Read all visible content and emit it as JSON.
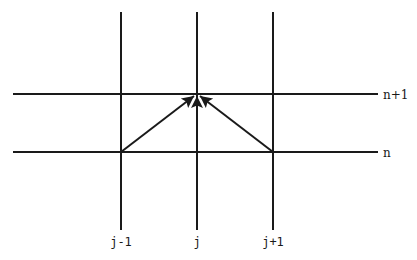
{
  "diagram": {
    "type": "finite-difference-stencil",
    "grid": {
      "line_color": "#1a1a1a",
      "vertical_lines": [
        {
          "label": "j-1",
          "x": 121
        },
        {
          "label": "j",
          "x": 197
        },
        {
          "label": "j+1",
          "x": 273
        }
      ],
      "horizontal_lines": [
        {
          "label": "n+1",
          "y": 94
        },
        {
          "label": "n",
          "y": 152
        }
      ]
    },
    "labels": {
      "col_left": "j-1",
      "col_center": "j",
      "col_right": "j+1",
      "row_top": "n+1",
      "row_bottom": "n"
    },
    "arrows": [
      {
        "from": "(j-1, n)",
        "to": "(j, n+1)"
      },
      {
        "from": "(j, n)",
        "to": "(j, n+1)"
      },
      {
        "from": "(j+1, n)",
        "to": "(j, n+1)"
      }
    ]
  }
}
